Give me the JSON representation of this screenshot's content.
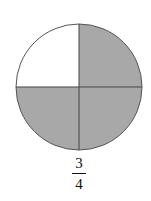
{
  "diagram": {
    "type": "fraction-circle",
    "parts_total": 4,
    "parts_shaded": 3,
    "unshaded_quadrant": "top-left",
    "shade_color": "#a8a8a8",
    "stroke_color": "#555555",
    "background_color": "#ffffff"
  },
  "label": {
    "numerator": "3",
    "denominator": "4"
  }
}
